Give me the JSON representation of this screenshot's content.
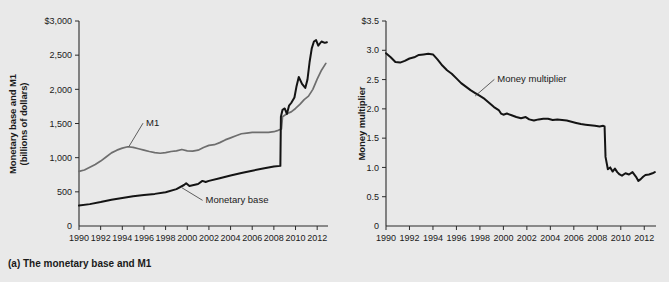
{
  "figure": {
    "background_color": "#e9e9e9",
    "panels": [
      {
        "caption": "(a) The monetary base and M1"
      },
      {
        "caption": "(b) The money multiplier"
      }
    ]
  },
  "chart_data": [
    {
      "type": "line",
      "title": "(a) The monetary base and M1",
      "xlabel": "",
      "ylabel": "Monetary base and M1 (billions of dollars)",
      "ylabel_line1": "Monetary base and M1",
      "ylabel_line2": "(billions of dollars)",
      "xlim": [
        1990,
        2013
      ],
      "ylim": [
        0,
        3000
      ],
      "grid": false,
      "legend_position": "inline-annotations",
      "ytick_labels": [
        "$3,000",
        "2,500",
        "2,000",
        "1,500",
        "1,000",
        "500",
        "0"
      ],
      "ytick_values": [
        3000,
        2500,
        2000,
        1500,
        1000,
        500,
        0
      ],
      "xtick_labels": [
        "1990",
        "1992",
        "1994",
        "1996",
        "1998",
        "2000",
        "2002",
        "2004",
        "2006",
        "2008",
        "2010",
        "2012"
      ],
      "xtick_values": [
        1990,
        1992,
        1994,
        1996,
        1998,
        2000,
        2002,
        2004,
        2006,
        2008,
        2010,
        2012
      ],
      "annotations": [
        {
          "text": "M1",
          "x": 1996.1,
          "y": 1520,
          "target_x": 1994.6,
          "target_y": 1160
        },
        {
          "text": "Monetary base",
          "x": 2001.6,
          "y": 390,
          "target_x": 1999.5,
          "target_y": 560
        }
      ],
      "series": [
        {
          "name": "M1",
          "color": "#6e6e6e",
          "x": [
            1990.0,
            1990.5,
            1991.0,
            1991.5,
            1992.0,
            1992.5,
            1993.0,
            1993.5,
            1994.0,
            1994.5,
            1995.0,
            1995.5,
            1996.0,
            1996.5,
            1997.0,
            1997.5,
            1998.0,
            1998.5,
            1999.0,
            1999.5,
            2000.0,
            2000.5,
            2001.0,
            2001.5,
            2002.0,
            2002.5,
            2003.0,
            2003.5,
            2004.0,
            2004.5,
            2005.0,
            2005.5,
            2006.0,
            2006.5,
            2007.0,
            2007.5,
            2008.0,
            2008.4,
            2008.7,
            2008.8,
            2009.0,
            2009.3,
            2009.6,
            2010.0,
            2010.4,
            2010.8,
            2011.2,
            2011.6,
            2012.0,
            2012.4,
            2012.8
          ],
          "y": [
            800,
            820,
            860,
            900,
            950,
            1010,
            1070,
            1110,
            1140,
            1160,
            1150,
            1130,
            1110,
            1090,
            1075,
            1065,
            1075,
            1090,
            1100,
            1120,
            1100,
            1095,
            1110,
            1150,
            1180,
            1190,
            1220,
            1260,
            1290,
            1320,
            1350,
            1360,
            1370,
            1370,
            1370,
            1370,
            1380,
            1400,
            1420,
            1600,
            1620,
            1650,
            1670,
            1720,
            1780,
            1850,
            1900,
            2000,
            2150,
            2280,
            2380
          ]
        },
        {
          "name": "Monetary base",
          "color": "#141414",
          "x": [
            1990.0,
            1991.0,
            1992.0,
            1993.0,
            1994.0,
            1995.0,
            1996.0,
            1997.0,
            1998.0,
            1999.0,
            1999.7,
            1999.9,
            2000.2,
            2001.0,
            2001.4,
            2001.7,
            2002.0,
            2003.0,
            2004.0,
            2005.0,
            2006.0,
            2007.0,
            2007.5,
            2008.0,
            2008.6,
            2008.65,
            2008.8,
            2009.0,
            2009.2,
            2009.4,
            2009.6,
            2009.9,
            2010.1,
            2010.3,
            2010.6,
            2010.9,
            2011.1,
            2011.3,
            2011.5,
            2011.7,
            2011.9,
            2012.1,
            2012.4,
            2012.7,
            2012.9
          ],
          "y": [
            300,
            320,
            350,
            385,
            410,
            435,
            455,
            470,
            495,
            540,
            600,
            625,
            585,
            615,
            660,
            645,
            660,
            700,
            740,
            775,
            810,
            840,
            855,
            870,
            880,
            1600,
            1700,
            1720,
            1640,
            1760,
            1800,
            1880,
            2050,
            2180,
            2080,
            2020,
            2140,
            2400,
            2600,
            2700,
            2720,
            2640,
            2700,
            2680,
            2690
          ]
        }
      ]
    },
    {
      "type": "line",
      "title": "(b) The money multiplier",
      "xlabel": "",
      "ylabel": "Money multiplier",
      "xlim": [
        1990,
        2013
      ],
      "ylim": [
        0,
        3.5
      ],
      "grid": false,
      "legend_position": "inline-annotations",
      "ytick_labels": [
        "$3.5",
        "3.0",
        "2.5",
        "2.0",
        "1.5",
        "1.0",
        "0.5",
        "0"
      ],
      "ytick_values": [
        3.5,
        3.0,
        2.5,
        2.0,
        1.5,
        1.0,
        0.5,
        0
      ],
      "xtick_labels": [
        "1990",
        "1992",
        "1994",
        "1996",
        "1998",
        "2000",
        "2002",
        "2004",
        "2006",
        "2008",
        "2010",
        "2012"
      ],
      "xtick_values": [
        1990,
        1992,
        1994,
        1996,
        1998,
        2000,
        2002,
        2004,
        2006,
        2008,
        2010,
        2012
      ],
      "annotations": [
        {
          "text": "Money multiplier",
          "x": 1999.4,
          "y": 2.52,
          "target_x": 1997.6,
          "target_y": 2.22
        }
      ],
      "series": [
        {
          "name": "Money multiplier",
          "color": "#141414",
          "x": [
            1990.0,
            1990.4,
            1990.8,
            1991.2,
            1991.6,
            1992.0,
            1992.4,
            1992.8,
            1993.2,
            1993.6,
            1994.0,
            1994.4,
            1994.8,
            1995.2,
            1995.6,
            1996.0,
            1996.4,
            1996.8,
            1997.2,
            1997.6,
            1998.0,
            1998.4,
            1998.8,
            1999.2,
            1999.6,
            1999.8,
            2000.0,
            2000.3,
            2000.7,
            2001.1,
            2001.5,
            2001.9,
            2002.2,
            2002.6,
            2003.0,
            2003.4,
            2003.8,
            2004.2,
            2004.6,
            2005.0,
            2005.4,
            2005.8,
            2006.2,
            2006.6,
            2007.0,
            2007.4,
            2007.8,
            2008.2,
            2008.5,
            2008.62,
            2008.7,
            2008.9,
            2009.1,
            2009.3,
            2009.5,
            2009.7,
            2009.9,
            2010.1,
            2010.4,
            2010.7,
            2011.0,
            2011.3,
            2011.5,
            2011.7,
            2011.9,
            2012.1,
            2012.4,
            2012.7,
            2012.9
          ],
          "y": [
            2.95,
            2.88,
            2.8,
            2.79,
            2.82,
            2.86,
            2.88,
            2.92,
            2.93,
            2.94,
            2.93,
            2.84,
            2.74,
            2.66,
            2.6,
            2.52,
            2.44,
            2.38,
            2.32,
            2.27,
            2.22,
            2.17,
            2.1,
            2.03,
            1.98,
            1.92,
            1.9,
            1.92,
            1.89,
            1.86,
            1.84,
            1.86,
            1.82,
            1.8,
            1.82,
            1.83,
            1.83,
            1.81,
            1.82,
            1.81,
            1.8,
            1.78,
            1.76,
            1.74,
            1.73,
            1.72,
            1.71,
            1.7,
            1.71,
            1.7,
            1.18,
            0.97,
            1.0,
            0.93,
            0.98,
            0.92,
            0.88,
            0.86,
            0.9,
            0.88,
            0.92,
            0.84,
            0.77,
            0.8,
            0.84,
            0.87,
            0.88,
            0.9,
            0.92
          ]
        }
      ]
    }
  ]
}
